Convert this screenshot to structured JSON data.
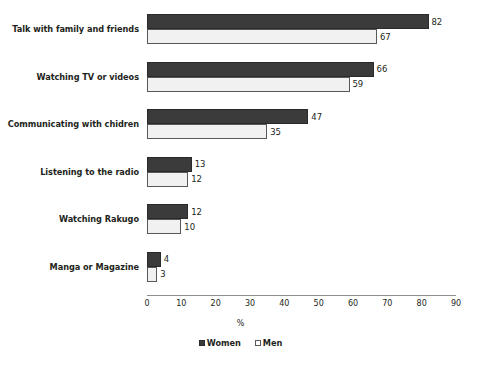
{
  "chart_data": {
    "type": "bar",
    "orientation": "horizontal",
    "title": "",
    "subtitle": "",
    "xlabel": "%",
    "ylabel": "",
    "xlim": [
      0,
      90
    ],
    "xticks": [
      "0",
      "10",
      "20",
      "30",
      "40",
      "50",
      "60",
      "70",
      "80",
      "90"
    ],
    "grid": false,
    "legend_position": "bottom-center",
    "categories": [
      "Talk with family and friends",
      "Watching TV or videos",
      "Communicating with chidren",
      "Listening to the radio",
      "Watching Rakugo",
      "Manga or Magazine"
    ],
    "series": [
      {
        "name": "Women",
        "color": "#3b3b3b",
        "values": [
          82,
          66,
          47,
          13,
          12,
          4
        ]
      },
      {
        "name": "Men",
        "color": "#f1f1f1",
        "values": [
          67,
          59,
          35,
          12,
          10,
          3
        ]
      }
    ]
  },
  "legend": {
    "items": [
      {
        "label": "Women",
        "swatch": "filled-dark-square-icon"
      },
      {
        "label": "Men",
        "swatch": "outlined-white-square-icon"
      }
    ]
  }
}
